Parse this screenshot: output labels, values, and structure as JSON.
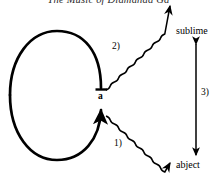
{
  "page": {
    "running_head": "The Music of Diamanda Ga",
    "background_color": "#ffffff",
    "ink_color": "#000000",
    "width": 217,
    "height": 181
  },
  "figure": {
    "name": "abject-sublime-cycle-diagram",
    "nodes": [
      {
        "id": "a",
        "label": "a",
        "x": 101,
        "y": 97
      },
      {
        "id": "sublime",
        "label": "sublime",
        "x": 196,
        "y": 33
      },
      {
        "id": "abject",
        "label": "abject",
        "x": 196,
        "y": 166
      }
    ],
    "loop": {
      "name": "closed-cycle-ellipse",
      "cx": 57,
      "cy": 95,
      "rx": 47,
      "ry": 65,
      "gap_at": "right",
      "stroke_width": 2.6
    },
    "arrows": [
      {
        "id": "arrow-1",
        "label": "1)",
        "style": "wavy",
        "from": "a",
        "to": "abject",
        "label_x": 114,
        "label_y": 139
      },
      {
        "id": "arrow-2",
        "label": "2)",
        "style": "wavy",
        "from": "a",
        "to": "sublime",
        "label_x": 112,
        "label_y": 42
      },
      {
        "id": "arrow-3",
        "label": "3)",
        "style": "straight-double-headed",
        "from": "sublime",
        "to": "abject",
        "label_x": 201,
        "label_y": 88
      }
    ]
  }
}
